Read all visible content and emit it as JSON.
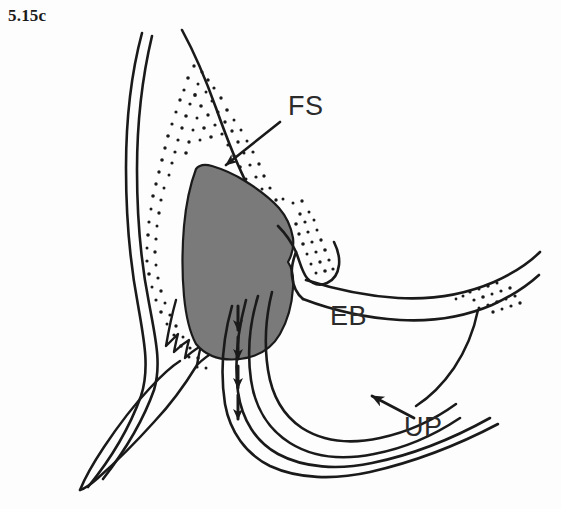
{
  "figure": {
    "number_label": "5.15c",
    "caption_font_style": "bold-serif",
    "background_color": "#fdfdfd",
    "ink_color": "#1a1a1a",
    "shaded_region_color": "#7b7a7b",
    "type": "anatomical-line-drawing"
  },
  "annotations": [
    {
      "id": "fs",
      "label": "FS",
      "meaning": "frontal-sinus",
      "text_x": 288,
      "text_y": 115,
      "leader": {
        "from_x": 280,
        "from_y": 122,
        "to_x": 222,
        "to_y": 168,
        "arrowhead": "filled-triangle",
        "direction": "down-left"
      }
    },
    {
      "id": "eb",
      "label": "EB",
      "meaning": "ethmoidal-bulla",
      "text_x": 330,
      "text_y": 325,
      "leader": null
    },
    {
      "id": "up",
      "label": "UP",
      "meaning": "uncinate-process",
      "text_x": 404,
      "text_y": 436,
      "leader": {
        "from_x": 412,
        "from_y": 416,
        "to_x": 366,
        "to_y": 393,
        "arrowhead": "filled-triangle",
        "direction": "up-left"
      }
    }
  ],
  "drainage_arrows": {
    "name": "drainage-arrow-chain",
    "count": 4,
    "direction": "downward",
    "x": 238,
    "segments": [
      {
        "y_start": 306,
        "y_end": 332
      },
      {
        "y_start": 335,
        "y_end": 361
      },
      {
        "y_start": 364,
        "y_end": 390
      },
      {
        "y_start": 393,
        "y_end": 421
      }
    ]
  },
  "shaded_mass": {
    "name": "frontal-sinus-cavity",
    "fill": "#7b7a7b",
    "outline": "#1a1a1a"
  },
  "stipple_fields": [
    {
      "name": "superior-stipple-field",
      "region": "above-sinus-upper-left"
    },
    {
      "name": "left-marginal-stipple-field",
      "region": "left-of-sinus"
    },
    {
      "name": "right-notch-stipple-field",
      "region": "right-of-sinus-notch"
    },
    {
      "name": "distal-band-stipple-field",
      "region": "upper-right-band-end"
    }
  ]
}
